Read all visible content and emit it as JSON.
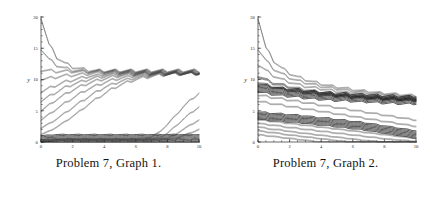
{
  "figures": [
    {
      "caption": "Problem 7, Graph 1.",
      "chart_ref": 0
    },
    {
      "caption": "Problem 7, Graph 2.",
      "chart_ref": 1
    }
  ],
  "chart_data": [
    {
      "type": "line",
      "title": "Problem 7, Graph 1.",
      "xlabel": "t",
      "ylabel": "y",
      "xlim": [
        0,
        10
      ],
      "ylim": [
        0,
        20
      ],
      "xticks": [
        0,
        2,
        4,
        6,
        8,
        10
      ],
      "xtick_labels": [
        "0",
        "2",
        "4",
        "6",
        "8",
        "10"
      ],
      "yticks": [
        0,
        5,
        10,
        15,
        20
      ],
      "ytick_labels": [
        "0",
        "5",
        "10",
        "15",
        "20"
      ],
      "grid": false,
      "legend": "none",
      "minor_ticks": true,
      "annotation": "Solutions of a forced sawtooth-driven equation; trajectories from many initial conditions either rise toward or decay toward a periodic solution near y = 11, while a separate bundle hugs y = 0 and a few late trajectories escape upward after t = 7.",
      "x": [
        0,
        0.5,
        1,
        1.5,
        2,
        2.5,
        3,
        3.5,
        4,
        4.5,
        5,
        5.5,
        6,
        6.5,
        7,
        7.5,
        8,
        8.5,
        9,
        9.5,
        10
      ],
      "series": [
        {
          "name": "y0 = 20",
          "emphasis": "light",
          "values": [
            20.0,
            15.6,
            13.6,
            12.6,
            12.0,
            11.7,
            11.5,
            11.4,
            11.4,
            11.4,
            11.4,
            11.4,
            11.4,
            11.4,
            11.4,
            11.4,
            11.4,
            11.4,
            11.4,
            11.4,
            11.4
          ]
        },
        {
          "name": "y0 = 15",
          "emphasis": "light",
          "values": [
            15.0,
            13.2,
            12.3,
            11.8,
            11.5,
            11.4,
            11.3,
            11.3,
            11.3,
            11.3,
            11.3,
            11.3,
            11.3,
            11.3,
            11.3,
            11.3,
            11.3,
            11.3,
            11.3,
            11.3,
            11.3
          ]
        },
        {
          "name": "y0 = 11.5",
          "emphasis": "light",
          "values": [
            11.5,
            11.4,
            11.3,
            11.3,
            11.3,
            11.2,
            11.2,
            11.2,
            11.2,
            11.2,
            11.2,
            11.2,
            11.2,
            11.2,
            11.2,
            11.2,
            11.2,
            11.2,
            11.2,
            11.2,
            11.2
          ]
        },
        {
          "name": "y0 = 10",
          "emphasis": "light",
          "values": [
            10.0,
            10.2,
            10.4,
            10.6,
            10.7,
            10.8,
            10.9,
            11.0,
            11.0,
            11.1,
            11.1,
            11.1,
            11.1,
            11.1,
            11.1,
            11.1,
            11.1,
            11.1,
            11.1,
            11.1,
            11.1
          ]
        },
        {
          "name": "y0 = 8",
          "emphasis": "light",
          "values": [
            8.0,
            8.6,
            9.1,
            9.6,
            9.9,
            10.2,
            10.5,
            10.6,
            10.8,
            10.9,
            11.0,
            11.0,
            11.0,
            11.0,
            11.0,
            11.0,
            11.0,
            11.0,
            11.0,
            11.0,
            11.0
          ]
        },
        {
          "name": "y0 = 6.5",
          "emphasis": "light",
          "values": [
            6.5,
            7.3,
            8.0,
            8.7,
            9.2,
            9.6,
            10.0,
            10.3,
            10.5,
            10.7,
            10.8,
            10.9,
            10.9,
            11.0,
            11.0,
            11.0,
            11.0,
            11.0,
            11.0,
            11.0,
            11.0
          ]
        },
        {
          "name": "y0 = 5",
          "emphasis": "light",
          "values": [
            5.0,
            5.9,
            6.8,
            7.6,
            8.3,
            8.9,
            9.4,
            9.8,
            10.1,
            10.4,
            10.6,
            10.7,
            10.8,
            10.9,
            10.9,
            11.0,
            11.0,
            11.0,
            11.0,
            11.0,
            11.0
          ]
        },
        {
          "name": "y0 = 3.5",
          "emphasis": "light",
          "values": [
            3.5,
            4.4,
            5.3,
            6.2,
            7.0,
            7.8,
            8.5,
            9.0,
            9.5,
            9.9,
            10.2,
            10.4,
            10.6,
            10.7,
            10.8,
            10.9,
            10.9,
            11.0,
            11.0,
            11.0,
            11.0
          ]
        },
        {
          "name": "y0 = 2.2",
          "emphasis": "light",
          "values": [
            2.2,
            2.9,
            3.7,
            4.6,
            5.5,
            6.4,
            7.2,
            8.0,
            8.7,
            9.2,
            9.7,
            10.0,
            10.3,
            10.5,
            10.7,
            10.8,
            10.9,
            10.9,
            11.0,
            11.0,
            11.0
          ]
        },
        {
          "name": "y0 = 1.2",
          "emphasis": "light",
          "values": [
            1.2,
            1.7,
            2.4,
            3.2,
            4.1,
            5.0,
            6.0,
            6.9,
            7.7,
            8.5,
            9.1,
            9.6,
            10.0,
            10.3,
            10.5,
            10.7,
            10.8,
            10.9,
            10.9,
            11.0,
            11.0
          ]
        },
        {
          "name": "lower bundle (dark, near 0)",
          "emphasis": "dark",
          "values": [
            0.4,
            0.5,
            0.6,
            0.6,
            0.6,
            0.6,
            0.6,
            0.6,
            0.6,
            0.6,
            0.6,
            0.6,
            0.6,
            0.6,
            0.6,
            0.6,
            0.6,
            0.6,
            0.6,
            0.6,
            0.6
          ]
        },
        {
          "name": "escaping trajectory A",
          "emphasis": "light",
          "values": [
            0.3,
            0.4,
            0.4,
            0.5,
            0.5,
            0.5,
            0.5,
            0.5,
            0.5,
            0.5,
            0.5,
            0.5,
            0.5,
            0.6,
            0.8,
            1.6,
            2.8,
            4.2,
            5.6,
            6.8,
            7.8
          ]
        },
        {
          "name": "escaping trajectory B",
          "emphasis": "light",
          "values": [
            0.3,
            0.3,
            0.4,
            0.4,
            0.4,
            0.4,
            0.4,
            0.4,
            0.4,
            0.4,
            0.4,
            0.4,
            0.4,
            0.4,
            0.5,
            0.7,
            1.4,
            2.5,
            3.6,
            4.7,
            5.6
          ]
        },
        {
          "name": "escaping trajectory C",
          "emphasis": "light",
          "values": [
            0.2,
            0.3,
            0.3,
            0.3,
            0.3,
            0.3,
            0.3,
            0.3,
            0.3,
            0.3,
            0.3,
            0.3,
            0.3,
            0.3,
            0.4,
            0.5,
            0.6,
            1.2,
            2.0,
            2.8,
            3.5
          ]
        },
        {
          "name": "escaping trajectory D",
          "emphasis": "light",
          "values": [
            0.2,
            0.2,
            0.2,
            0.2,
            0.2,
            0.2,
            0.2,
            0.2,
            0.2,
            0.2,
            0.2,
            0.2,
            0.2,
            0.2,
            0.3,
            0.3,
            0.4,
            0.6,
            1.0,
            1.5,
            2.0
          ]
        }
      ]
    },
    {
      "type": "line",
      "title": "Problem 7, Graph 2.",
      "xlabel": "t",
      "ylabel": "y",
      "xlim": [
        0,
        10
      ],
      "ylim": [
        0,
        20
      ],
      "xticks": [
        0,
        2,
        4,
        6,
        8,
        10
      ],
      "xtick_labels": [
        "0",
        "2",
        "4",
        "6",
        "8",
        "10"
      ],
      "yticks": [
        0,
        5,
        10,
        15,
        20
      ],
      "ytick_labels": [
        "0",
        "5",
        "10",
        "15",
        "20"
      ],
      "grid": false,
      "legend": "none",
      "minor_ticks": true,
      "annotation": "All trajectories decay with superimposed sawtooth oscillation; an upper bundle settles near y = 7 while a lower dark bundle drifts from y = 4 down toward y = 1, and several low trajectories fall to zero before t = 10.",
      "x": [
        0,
        0.5,
        1,
        1.5,
        2,
        2.5,
        3,
        3.5,
        4,
        4.5,
        5,
        5.5,
        6,
        6.5,
        7,
        7.5,
        8,
        8.5,
        9,
        9.5,
        10
      ],
      "series": [
        {
          "name": "y0 = 20",
          "emphasis": "light",
          "values": [
            20.0,
            15.0,
            13.0,
            11.8,
            11.0,
            10.4,
            10.0,
            9.6,
            9.3,
            9.0,
            8.8,
            8.6,
            8.4,
            8.2,
            8.1,
            7.9,
            7.8,
            7.7,
            7.6,
            7.5,
            7.4
          ]
        },
        {
          "name": "y0 = 15",
          "emphasis": "light",
          "values": [
            15.0,
            13.0,
            11.7,
            10.9,
            10.3,
            9.8,
            9.5,
            9.2,
            8.9,
            8.7,
            8.5,
            8.3,
            8.1,
            8.0,
            7.8,
            7.7,
            7.6,
            7.5,
            7.4,
            7.3,
            7.2
          ]
        },
        {
          "name": "y0 = 12.5",
          "emphasis": "light",
          "values": [
            12.5,
            11.4,
            10.6,
            10.0,
            9.6,
            9.2,
            8.9,
            8.7,
            8.5,
            8.3,
            8.1,
            7.9,
            7.8,
            7.7,
            7.5,
            7.4,
            7.3,
            7.2,
            7.2,
            7.1,
            7.0
          ]
        },
        {
          "name": "y0 = 10.5",
          "emphasis": "mid",
          "values": [
            10.5,
            9.9,
            9.4,
            9.1,
            8.8,
            8.5,
            8.3,
            8.1,
            7.9,
            7.8,
            7.6,
            7.5,
            7.4,
            7.3,
            7.2,
            7.1,
            7.0,
            7.0,
            6.9,
            6.9,
            6.8
          ]
        },
        {
          "name": "y0 = 9.5",
          "emphasis": "mid",
          "values": [
            9.5,
            9.1,
            8.8,
            8.5,
            8.3,
            8.1,
            7.9,
            7.8,
            7.6,
            7.5,
            7.4,
            7.3,
            7.2,
            7.1,
            7.0,
            7.0,
            6.9,
            6.8,
            6.8,
            6.7,
            6.7
          ]
        },
        {
          "name": "upper bundle (dark, near 7)",
          "emphasis": "dark",
          "values": [
            8.6,
            8.4,
            8.2,
            8.0,
            7.9,
            7.8,
            7.6,
            7.5,
            7.4,
            7.3,
            7.2,
            7.2,
            7.1,
            7.0,
            7.0,
            6.9,
            6.8,
            6.8,
            6.7,
            6.7,
            6.7
          ]
        },
        {
          "name": "y0 = 7.5",
          "emphasis": "light",
          "values": [
            7.5,
            7.3,
            7.1,
            6.9,
            6.7,
            6.5,
            6.3,
            6.1,
            5.9,
            5.7,
            5.5,
            5.3,
            5.1,
            4.9,
            4.7,
            4.5,
            4.3,
            4.1,
            3.9,
            3.7,
            3.5
          ]
        },
        {
          "name": "y0 = 6.5",
          "emphasis": "light",
          "values": [
            6.5,
            6.3,
            6.1,
            5.9,
            5.7,
            5.5,
            5.3,
            5.1,
            4.9,
            4.7,
            4.5,
            4.3,
            4.1,
            3.9,
            3.7,
            3.5,
            3.3,
            3.1,
            2.9,
            2.7,
            2.5
          ]
        },
        {
          "name": "lower bundle (dark, 4 -> 1)",
          "emphasis": "dark",
          "values": [
            4.2,
            4.1,
            4.0,
            3.9,
            3.8,
            3.7,
            3.6,
            3.4,
            3.3,
            3.2,
            3.0,
            2.9,
            2.7,
            2.6,
            2.4,
            2.2,
            2.0,
            1.8,
            1.6,
            1.4,
            1.2
          ]
        },
        {
          "name": "y0 = 3.6",
          "emphasis": "light",
          "values": [
            3.6,
            3.4,
            3.3,
            3.1,
            3.0,
            2.8,
            2.7,
            2.5,
            2.4,
            2.2,
            2.1,
            1.9,
            1.8,
            1.6,
            1.5,
            1.3,
            1.2,
            1.0,
            0.9,
            0.7,
            0.6
          ]
        },
        {
          "name": "y0 = 3.0",
          "emphasis": "light",
          "values": [
            3.0,
            2.8,
            2.7,
            2.5,
            2.3,
            2.2,
            2.0,
            1.9,
            1.7,
            1.6,
            1.4,
            1.3,
            1.1,
            1.0,
            0.8,
            0.7,
            0.5,
            0.4,
            0.3,
            0.2,
            0.1
          ]
        },
        {
          "name": "y0 = 2.4 (hits zero near t = 8.5)",
          "emphasis": "light",
          "values": [
            2.4,
            2.2,
            2.0,
            1.9,
            1.7,
            1.5,
            1.4,
            1.2,
            1.1,
            0.9,
            0.8,
            0.6,
            0.5,
            0.3,
            0.2,
            0.1,
            0.0,
            0.0,
            0.0,
            0.0,
            0.0
          ]
        },
        {
          "name": "y0 = 1.8 (hits zero near t = 6.5)",
          "emphasis": "light",
          "values": [
            1.8,
            1.6,
            1.5,
            1.3,
            1.1,
            1.0,
            0.8,
            0.7,
            0.5,
            0.4,
            0.2,
            0.1,
            0.0,
            0.0,
            0.0,
            0.0,
            0.0,
            0.0,
            0.0,
            0.0,
            0.0
          ]
        },
        {
          "name": "y0 = 1.2 (hits zero near t = 4.5)",
          "emphasis": "light",
          "values": [
            1.2,
            1.0,
            0.9,
            0.7,
            0.6,
            0.4,
            0.3,
            0.1,
            0.0,
            0.0,
            0.0,
            0.0,
            0.0,
            0.0,
            0.0,
            0.0,
            0.0,
            0.0,
            0.0,
            0.0,
            0.0
          ]
        }
      ]
    }
  ]
}
